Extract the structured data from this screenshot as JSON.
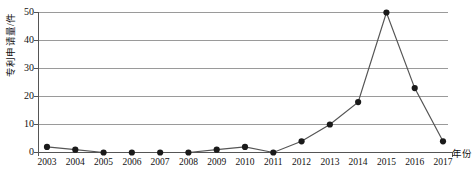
{
  "chart_data": {
    "type": "line",
    "title": "",
    "xlabel": "年份",
    "ylabel": "专利申请量/件",
    "categories": [
      "2003",
      "2004",
      "2005",
      "2006",
      "2007",
      "2008",
      "2009",
      "2010",
      "2011",
      "2012",
      "2013",
      "2014",
      "2015",
      "2016",
      "2017"
    ],
    "values": [
      2,
      1,
      0,
      0,
      0,
      0,
      1,
      2,
      0,
      4,
      10,
      18,
      50,
      23,
      4
    ],
    "ylim": [
      0,
      50
    ],
    "yticks": [
      0,
      10,
      20,
      30,
      40,
      50
    ],
    "ytick_labels": [
      "0",
      "10",
      "20",
      "30",
      "40",
      "50"
    ],
    "grid": "horizontal",
    "legend": "none",
    "series": [
      {
        "name": "专利申请量",
        "values": [
          2,
          1,
          0,
          0,
          0,
          0,
          1,
          2,
          0,
          4,
          10,
          18,
          50,
          23,
          4
        ],
        "marker": "filled-circle",
        "line_color": "#555555",
        "marker_color": "#1a1a1a"
      }
    ],
    "colors": {
      "line": "#555555",
      "marker": "#1a1a1a",
      "grid": "#9a9a9a",
      "axis": "#555555",
      "text": "#111111"
    }
  },
  "caption": {
    "text": ""
  }
}
